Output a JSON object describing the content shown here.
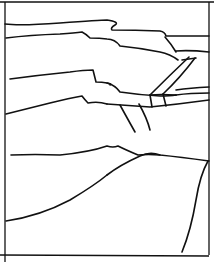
{
  "drawing": {
    "subject": "line sketch of layered hills with a road",
    "stroke_color": "#111111",
    "background": "#ffffff"
  }
}
